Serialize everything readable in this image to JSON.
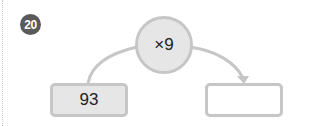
{
  "problem": {
    "number": "20",
    "operation": "×9",
    "input_value": "93",
    "output_value": ""
  },
  "colors": {
    "badge": "#5a5a5a",
    "shape_fill": "#e6e6e6",
    "shape_border": "#c6c6c6"
  }
}
